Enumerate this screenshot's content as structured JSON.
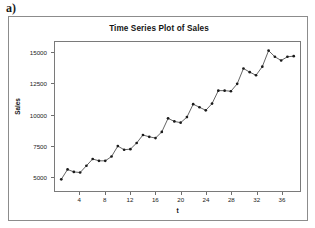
{
  "figure": {
    "part_label": "a)"
  },
  "chart_data": {
    "type": "line",
    "title": "Time Series Plot of Sales",
    "xlabel": "t",
    "ylabel": "Sales",
    "grid": false,
    "legend": null,
    "xlim": [
      0,
      39
    ],
    "ylim": [
      3800,
      15900
    ],
    "xticks": [
      4,
      8,
      12,
      16,
      20,
      24,
      28,
      32,
      36
    ],
    "xtick_labels": [
      "4",
      "8",
      "12",
      "16",
      "20",
      "24",
      "28",
      "32",
      "36"
    ],
    "yticks": [
      5000,
      7500,
      10000,
      12500,
      15000
    ],
    "ytick_labels": [
      "5000",
      "7500",
      "10000",
      "12500",
      "15000"
    ],
    "marker": "filled-circle",
    "line_color": "#3a3a3a",
    "marker_color": "#1a1a1a",
    "x": [
      1,
      2,
      3,
      4,
      5,
      6,
      7,
      8,
      9,
      10,
      11,
      12,
      13,
      14,
      15,
      16,
      17,
      18,
      19,
      20,
      21,
      22,
      23,
      24,
      25,
      26,
      27,
      28,
      29,
      30,
      31,
      32,
      33,
      34,
      35,
      36,
      37,
      38
    ],
    "values": [
      4750,
      5550,
      5350,
      5300,
      5850,
      6400,
      6250,
      6250,
      6600,
      7450,
      7150,
      7200,
      7700,
      8350,
      8200,
      8100,
      8600,
      9700,
      9450,
      9350,
      9800,
      10850,
      10600,
      10350,
      10900,
      11950,
      11950,
      11900,
      12500,
      13750,
      13450,
      13200,
      13900,
      15200,
      14700,
      14400,
      14700,
      14750
    ]
  }
}
